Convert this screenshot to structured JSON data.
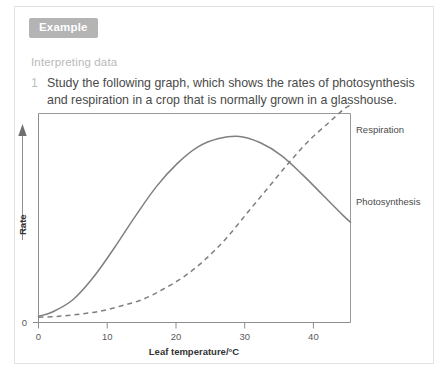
{
  "card": {
    "badge_label": "Example",
    "section_heading": "Interpreting data",
    "question_number": "1",
    "question_text": "Study the following graph, which shows the rates of photosynthesis and respiration in a crop that is normally grown in a glasshouse."
  },
  "colors": {
    "badge_background": "#b4b4b4",
    "badge_text": "#ffffff",
    "heading_text": "#b9b9b9",
    "body_text": "#4a4a4a",
    "curve_stroke": "#7f7f7f",
    "axis_stroke": "#8d8d8d",
    "card_border": "#e2e2e2",
    "page_background": "#ffffff"
  },
  "chart_data": {
    "type": "line",
    "title": "",
    "xlabel": "Leaf temperature/°C",
    "ylabel": "Rate",
    "xlim": [
      0,
      45
    ],
    "ylim": [
      0,
      10
    ],
    "xticks": [
      0,
      10,
      20,
      30,
      40
    ],
    "xtick_labels": [
      "0",
      "10",
      "20",
      "30",
      "40"
    ],
    "yticks": [
      0
    ],
    "ytick_labels": [
      "0"
    ],
    "grid": false,
    "legend_position": "right-inline-labels",
    "y_axis_arrow": true,
    "series": [
      {
        "name": "Photosynthesis",
        "style": "solid",
        "label": "Photosynthesis",
        "x": [
          0,
          2,
          5,
          8,
          11,
          14,
          17,
          20,
          23,
          26,
          29,
          32,
          35,
          38,
          41,
          44,
          45
        ],
        "values": [
          0.3,
          0.5,
          1.1,
          2.2,
          3.6,
          5.1,
          6.5,
          7.6,
          8.4,
          8.8,
          8.9,
          8.6,
          8.0,
          7.1,
          6.1,
          5.1,
          4.8
        ]
      },
      {
        "name": "Respiration",
        "style": "dashed",
        "label": "Respiration",
        "x": [
          0,
          3,
          6,
          9,
          12,
          15,
          18,
          21,
          24,
          27,
          30,
          33,
          36,
          39,
          42,
          44,
          45
        ],
        "values": [
          0.25,
          0.3,
          0.4,
          0.55,
          0.8,
          1.1,
          1.6,
          2.2,
          3.0,
          4.0,
          5.2,
          6.4,
          7.6,
          8.7,
          9.6,
          10.2,
          10.4
        ]
      }
    ],
    "annotations": [
      {
        "text": "Respiration",
        "at_x": 45,
        "at_y": 10.4
      },
      {
        "text": "Photosynthesis",
        "at_x": 45,
        "at_y": 4.8
      }
    ]
  }
}
